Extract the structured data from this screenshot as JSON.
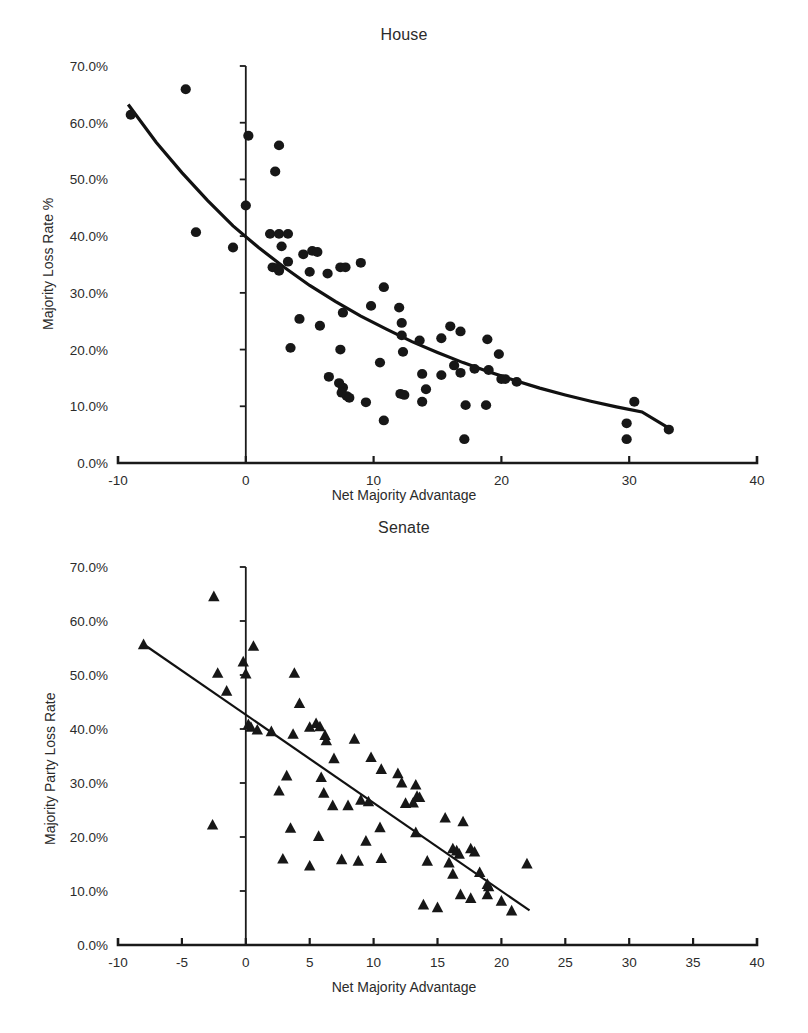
{
  "figure": {
    "background": "#ffffff",
    "marker_color": "#171717",
    "axis_color": "#1a1a1a"
  },
  "panels": [
    {
      "id": "house",
      "title": "House",
      "xlabel": "Net Majority Advantage",
      "ylabel": "Majority Loss Rate %"
    },
    {
      "id": "senate",
      "title": "Senate",
      "xlabel": "Net Majority Advantage",
      "ylabel": "Majority Party Loss Rate"
    }
  ],
  "chart_data": [
    {
      "type": "scatter",
      "title": "House",
      "xlabel": "Net Majority Advantage",
      "ylabel": "Majority Loss Rate %",
      "xlim": [
        -10,
        40
      ],
      "ylim": [
        0,
        0.7
      ],
      "xticks": [
        -10,
        0,
        10,
        20,
        30,
        40
      ],
      "xtick_labels": [
        "-10",
        "0",
        "10",
        "20",
        "30",
        "40"
      ],
      "yticks": [
        0,
        0.1,
        0.2,
        0.3,
        0.4,
        0.5,
        0.6,
        0.7
      ],
      "ytick_labels": [
        "0.0%",
        "10.0%",
        "20.0%",
        "30.0%",
        "40.0%",
        "50.0%",
        "60.0%",
        "70.0%"
      ],
      "grid": false,
      "legend": null,
      "marker": "circle",
      "series": [
        {
          "name": "House elections",
          "marker": "circle",
          "points": [
            [
              -9.0,
              0.614
            ],
            [
              -4.7,
              0.659
            ],
            [
              -3.9,
              0.407
            ],
            [
              -1.0,
              0.38
            ],
            [
              0.2,
              0.577
            ],
            [
              0.0,
              0.454
            ],
            [
              2.6,
              0.56
            ],
            [
              2.3,
              0.514
            ],
            [
              1.9,
              0.404
            ],
            [
              2.6,
              0.404
            ],
            [
              3.3,
              0.404
            ],
            [
              2.8,
              0.382
            ],
            [
              3.3,
              0.355
            ],
            [
              4.5,
              0.368
            ],
            [
              5.2,
              0.374
            ],
            [
              5.6,
              0.372
            ],
            [
              2.1,
              0.345
            ],
            [
              2.5,
              0.344
            ],
            [
              2.6,
              0.339
            ],
            [
              5.0,
              0.337
            ],
            [
              6.4,
              0.334
            ],
            [
              7.4,
              0.345
            ],
            [
              7.8,
              0.345
            ],
            [
              9.0,
              0.353
            ],
            [
              10.8,
              0.31
            ],
            [
              9.8,
              0.277
            ],
            [
              12.0,
              0.274
            ],
            [
              7.6,
              0.265
            ],
            [
              4.2,
              0.254
            ],
            [
              12.2,
              0.247
            ],
            [
              16.0,
              0.241
            ],
            [
              16.8,
              0.232
            ],
            [
              18.9,
              0.218
            ],
            [
              12.2,
              0.225
            ],
            [
              13.6,
              0.216
            ],
            [
              15.3,
              0.22
            ],
            [
              5.8,
              0.242
            ],
            [
              3.5,
              0.203
            ],
            [
              7.4,
              0.2
            ],
            [
              12.3,
              0.196
            ],
            [
              19.8,
              0.192
            ],
            [
              10.5,
              0.177
            ],
            [
              16.3,
              0.172
            ],
            [
              17.9,
              0.166
            ],
            [
              19.0,
              0.164
            ],
            [
              15.3,
              0.155
            ],
            [
              16.8,
              0.159
            ],
            [
              20.0,
              0.148
            ],
            [
              20.3,
              0.148
            ],
            [
              21.2,
              0.143
            ],
            [
              13.8,
              0.157
            ],
            [
              6.5,
              0.152
            ],
            [
              7.3,
              0.141
            ],
            [
              7.6,
              0.133
            ],
            [
              14.1,
              0.13
            ],
            [
              7.5,
              0.124
            ],
            [
              7.9,
              0.118
            ],
            [
              12.1,
              0.122
            ],
            [
              12.4,
              0.12
            ],
            [
              8.1,
              0.115
            ],
            [
              9.4,
              0.107
            ],
            [
              13.8,
              0.108
            ],
            [
              17.2,
              0.102
            ],
            [
              18.8,
              0.102
            ],
            [
              30.4,
              0.108
            ],
            [
              10.8,
              0.075
            ],
            [
              29.8,
              0.07
            ],
            [
              33.1,
              0.059
            ],
            [
              29.8,
              0.042
            ],
            [
              17.1,
              0.042
            ]
          ]
        }
      ],
      "trendline": {
        "kind": "exponential-fit",
        "points": [
          [
            -9.2,
            0.632
          ],
          [
            -7.0,
            0.565
          ],
          [
            -5.0,
            0.512
          ],
          [
            -3.0,
            0.463
          ],
          [
            -1.0,
            0.418
          ],
          [
            1.0,
            0.38
          ],
          [
            3.0,
            0.345
          ],
          [
            5.0,
            0.313
          ],
          [
            7.0,
            0.285
          ],
          [
            9.0,
            0.259
          ],
          [
            11.0,
            0.236
          ],
          [
            13.0,
            0.214
          ],
          [
            15.0,
            0.195
          ],
          [
            17.0,
            0.177
          ],
          [
            19.0,
            0.161
          ],
          [
            21.0,
            0.146
          ],
          [
            23.0,
            0.132
          ],
          [
            25.0,
            0.12
          ],
          [
            27.0,
            0.109
          ],
          [
            29.0,
            0.099
          ],
          [
            31.0,
            0.09
          ],
          [
            33.2,
            0.06
          ]
        ]
      }
    },
    {
      "type": "scatter",
      "title": "Senate",
      "xlabel": "Net Majority Advantage",
      "ylabel": "Majority Party Loss Rate",
      "xlim": [
        -10,
        40
      ],
      "ylim": [
        0,
        0.7
      ],
      "xticks": [
        -10,
        -5,
        0,
        5,
        10,
        15,
        20,
        25,
        30,
        35,
        40
      ],
      "xtick_labels": [
        "-10",
        "-5",
        "0",
        "5",
        "10",
        "15",
        "20",
        "25",
        "30",
        "35",
        "40"
      ],
      "yticks": [
        0,
        0.1,
        0.2,
        0.3,
        0.4,
        0.5,
        0.6,
        0.7
      ],
      "ytick_labels": [
        "0.0%",
        "10.0%",
        "20.0%",
        "30.0%",
        "40.0%",
        "50.0%",
        "60.0%",
        "70.0%"
      ],
      "grid": false,
      "legend": null,
      "marker": "triangle",
      "series": [
        {
          "name": "Senate elections",
          "marker": "triangle",
          "points": [
            [
              -2.5,
              0.645
            ],
            [
              -8.0,
              0.556
            ],
            [
              0.6,
              0.553
            ],
            [
              -0.2,
              0.524
            ],
            [
              -2.2,
              0.503
            ],
            [
              0.0,
              0.502
            ],
            [
              3.8,
              0.503
            ],
            [
              -1.5,
              0.47
            ],
            [
              4.2,
              0.447
            ],
            [
              0.2,
              0.408
            ],
            [
              0.4,
              0.403
            ],
            [
              2.0,
              0.395
            ],
            [
              5.5,
              0.41
            ],
            [
              5.8,
              0.404
            ],
            [
              3.7,
              0.39
            ],
            [
              5.0,
              0.403
            ],
            [
              6.2,
              0.388
            ],
            [
              6.3,
              0.378
            ],
            [
              8.5,
              0.381
            ],
            [
              0.9,
              0.398
            ],
            [
              6.9,
              0.345
            ],
            [
              9.8,
              0.347
            ],
            [
              10.6,
              0.325
            ],
            [
              11.9,
              0.317
            ],
            [
              3.2,
              0.313
            ],
            [
              5.9,
              0.31
            ],
            [
              12.2,
              0.3
            ],
            [
              13.3,
              0.296
            ],
            [
              2.6,
              0.285
            ],
            [
              6.1,
              0.281
            ],
            [
              9.0,
              0.268
            ],
            [
              9.6,
              0.265
            ],
            [
              12.5,
              0.262
            ],
            [
              13.1,
              0.263
            ],
            [
              13.4,
              0.275
            ],
            [
              13.6,
              0.273
            ],
            [
              6.8,
              0.258
            ],
            [
              8.0,
              0.258
            ],
            [
              15.6,
              0.235
            ],
            [
              17.0,
              0.228
            ],
            [
              -2.6,
              0.222
            ],
            [
              3.5,
              0.216
            ],
            [
              10.5,
              0.217
            ],
            [
              13.3,
              0.208
            ],
            [
              5.7,
              0.201
            ],
            [
              9.4,
              0.192
            ],
            [
              16.2,
              0.178
            ],
            [
              16.5,
              0.174
            ],
            [
              17.6,
              0.178
            ],
            [
              17.9,
              0.172
            ],
            [
              16.7,
              0.168
            ],
            [
              2.9,
              0.159
            ],
            [
              7.5,
              0.158
            ],
            [
              8.8,
              0.155
            ],
            [
              10.6,
              0.16
            ],
            [
              14.2,
              0.155
            ],
            [
              15.9,
              0.152
            ],
            [
              22.0,
              0.15
            ],
            [
              5.0,
              0.146
            ],
            [
              16.2,
              0.131
            ],
            [
              18.3,
              0.134
            ],
            [
              18.9,
              0.112
            ],
            [
              19.0,
              0.108
            ],
            [
              16.8,
              0.093
            ],
            [
              18.9,
              0.093
            ],
            [
              17.6,
              0.086
            ],
            [
              20.0,
              0.081
            ],
            [
              13.9,
              0.074
            ],
            [
              15.0,
              0.069
            ],
            [
              20.8,
              0.063
            ]
          ]
        }
      ],
      "trendline": {
        "kind": "linear-fit",
        "points": [
          [
            -8.0,
            0.557
          ],
          [
            22.2,
            0.064
          ]
        ]
      }
    }
  ]
}
